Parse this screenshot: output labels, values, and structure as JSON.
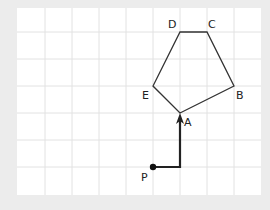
{
  "diagram": {
    "background": "#ececec",
    "grid": {
      "area": {
        "x": 17,
        "y": 8,
        "width": 244,
        "height": 187
      },
      "fill": "#ffffff",
      "line_color": "#e2e2e2",
      "spacing": 27,
      "vertical_lines": [
        45,
        72,
        99,
        126,
        153,
        180,
        207,
        234
      ],
      "horizontal_lines": [
        32,
        59,
        86,
        113,
        140,
        167
      ]
    },
    "pentagon": {
      "stroke": "#333333",
      "vertices": [
        {
          "name": "A",
          "x": 180,
          "y": 113,
          "label_x": 184,
          "label_y": 126
        },
        {
          "name": "B",
          "x": 234,
          "y": 86,
          "label_x": 236,
          "label_y": 99
        },
        {
          "name": "C",
          "x": 207,
          "y": 32,
          "label_x": 208,
          "label_y": 28
        },
        {
          "name": "D",
          "x": 180,
          "y": 32,
          "label_x": 168,
          "label_y": 28
        },
        {
          "name": "E",
          "x": 153,
          "y": 86,
          "label_x": 142,
          "label_y": 99
        }
      ]
    },
    "path": {
      "stroke": "#222222",
      "start": {
        "name": "P",
        "x": 153,
        "y": 167,
        "label_x": 141,
        "label_y": 181
      },
      "corner": {
        "x": 180,
        "y": 167
      },
      "end": {
        "name": "A",
        "x": 180,
        "y": 113
      }
    }
  }
}
